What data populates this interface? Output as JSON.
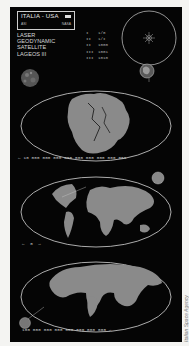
{
  "header": {
    "title": "ITALIA - USA",
    "subtitle_left": "ASI",
    "subtitle_right": "NASA"
  },
  "mission_labels": [
    "LASER",
    "GEODYNAMIC",
    "SATELLITE",
    "LAGEOS III"
  ],
  "number_columns": {
    "col1": [
      "I",
      "II",
      "II",
      "III",
      "III"
    ],
    "col2": [
      "1/0",
      "1/I",
      "1000",
      "1001",
      "1010"
    ]
  },
  "maps": [
    {
      "name": "pangaea",
      "era": "past"
    },
    {
      "name": "present-world",
      "era": "present"
    },
    {
      "name": "future-world",
      "era": "future"
    }
  ],
  "timeline": {
    "past_arrow": "←",
    "past_scale": "10 000 000 000 000 000 000 000 000 000",
    "present_left_arrow": "←",
    "present_marker": "0",
    "present_right_arrow": "→",
    "future_scale": "100 000 000 000 000 000 000 000",
    "future_arrow": "→"
  },
  "credit": "Italian Space Agency",
  "colors": {
    "background": "#050505",
    "land": "#8a8a8a",
    "outline": "#d6d6d6",
    "page": "#f4f4f2"
  }
}
